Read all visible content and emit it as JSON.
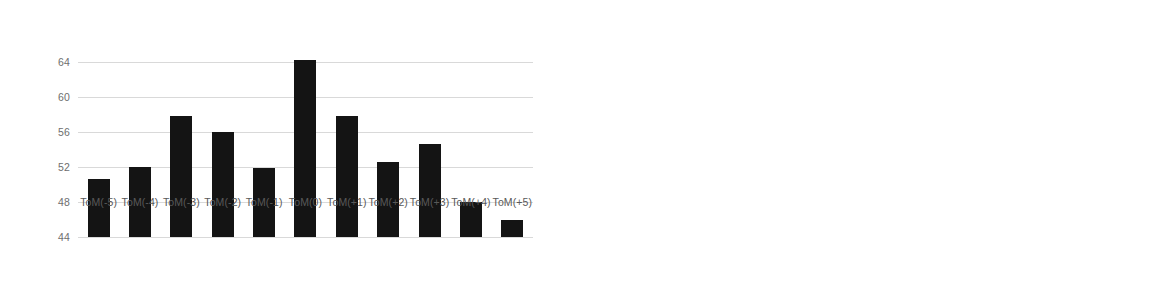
{
  "chart_data": [
    {
      "panel": "left",
      "type": "bar",
      "title": "",
      "xlabel": "",
      "ylabel": "",
      "ylim": [
        44,
        66
      ],
      "grid": true,
      "legend": "none",
      "yticks": [
        44,
        48,
        52,
        56,
        60,
        64
      ],
      "ytick_labels": [
        "44",
        "48",
        "52",
        "56",
        "60",
        "64"
      ],
      "categories": [
        "ToM(-5)",
        "ToM(-4)",
        "ToM(-3)",
        "ToM(-2)",
        "ToM(-1)",
        "ToM(0)",
        "ToM(+1)",
        "ToM(+2)",
        "ToM(+3)",
        "ToM(+4)",
        "ToM(+5)"
      ],
      "values": [
        50.7,
        52.0,
        57.9,
        56.0,
        51.9,
        64.3,
        57.9,
        52.6,
        54.6,
        48.0,
        46.0
      ],
      "bar_color": "#141414"
    },
    {
      "panel": "right",
      "type": "bar",
      "title": "",
      "xlabel": "",
      "ylabel": "",
      "ylim": [
        -0.1,
        0.4
      ],
      "grid": true,
      "legend": "none",
      "yticks": [
        -0.1,
        0.0,
        0.1,
        0.2,
        0.3,
        0.4
      ],
      "ytick_labels": [
        "-0.10",
        "0.00",
        "0.10",
        "0.20",
        "0.30",
        "0.40"
      ],
      "categories": [
        "ToM(-5)",
        "ToM(-4)",
        "ToM(-3)",
        "ToM(-2)",
        "ToM(-1)",
        "ToM(0)",
        "ToM(+1)",
        "ToM(+2)",
        "ToM(+3)",
        "ToM(+4)",
        "ToM(+5)"
      ],
      "values": [
        0.142,
        -0.01,
        0.19,
        0.066,
        0.125,
        0.284,
        0.094,
        0.028,
        -0.063,
        0.009,
        -0.058
      ],
      "bar_color": "#141414"
    }
  ]
}
